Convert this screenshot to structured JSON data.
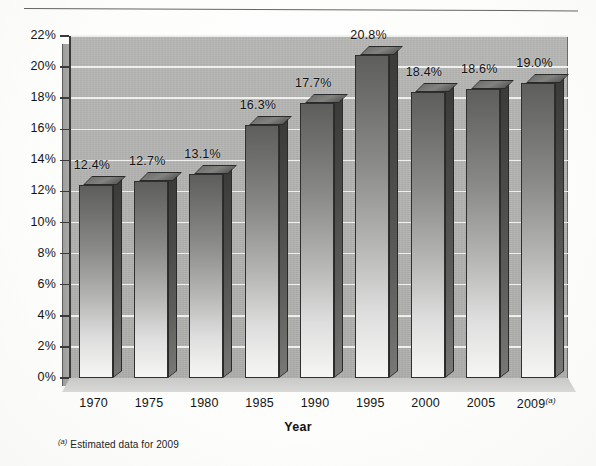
{
  "chart_data": {
    "type": "bar",
    "title": "",
    "subtitle": "",
    "xlabel": "Year",
    "ylabel": "",
    "categories": [
      "1970",
      "1975",
      "1980",
      "1985",
      "1990",
      "1995",
      "2000",
      "2005",
      "2009"
    ],
    "category_suffixes": [
      "",
      "",
      "",
      "",
      "",
      "",
      "",
      "",
      "(a)"
    ],
    "values": [
      12.4,
      12.7,
      13.1,
      16.3,
      17.7,
      20.8,
      18.4,
      18.6,
      19.0
    ],
    "data_labels": [
      "12.4%",
      "12.7%",
      "13.1%",
      "16.3%",
      "17.7%",
      "20.8%",
      "18.4%",
      "18.6%",
      "19.0%"
    ],
    "ylim": [
      0,
      22
    ],
    "ytick_values": [
      0,
      2,
      4,
      6,
      8,
      10,
      12,
      14,
      16,
      18,
      20,
      22
    ],
    "ytick_labels": [
      "0%",
      "2%",
      "4%",
      "6%",
      "8%",
      "10%",
      "12%",
      "14%",
      "16%",
      "18%",
      "20%",
      "22%"
    ],
    "grid": true,
    "legend": false,
    "legend_position": "none",
    "three_d": true,
    "annotations": [
      "(a) Estimated data for 2009"
    ]
  },
  "footnote": {
    "marker": "(a)",
    "text": "Estimated data for 2009"
  },
  "colors": {
    "bar_top_face": "#6f6f6d",
    "bar_front_dark": "#5e5e5c",
    "bar_front_light": "#f6f6f4",
    "bar_side": "#4a4a48",
    "plot_background": "#b2b2b0",
    "gridline": "#f2f2f0",
    "axis": "#3a3a3a",
    "text": "#141414",
    "page_background": "#ffffff"
  }
}
